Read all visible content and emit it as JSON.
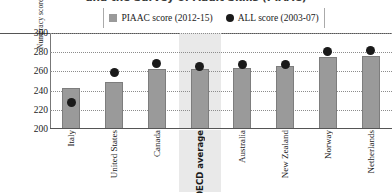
{
  "title": "and the Survey of Adult Skills (PIAAC)",
  "legend": {
    "bar_label": "PIAAC score (2012-15)",
    "dot_label": "ALL score (2003-07)",
    "bar_icon": "square-swatch-icon",
    "dot_icon": "circle-swatch-icon",
    "bar_color": "#9a9a9a",
    "dot_color": "#1a1a1a"
  },
  "axis": {
    "ylabel": "Numeracy score",
    "yticks": [
      "300",
      "280",
      "260",
      "240",
      "220",
      "200"
    ]
  },
  "highlight": {
    "category": "OECD average",
    "color": "#e9e9e9"
  },
  "chart_data": {
    "type": "bar",
    "title": "and the Survey of Adult Skills (PIAAC)",
    "xlabel": "",
    "ylabel": "Numeracy score",
    "ylim": [
      200,
      300
    ],
    "ytick_step": 20,
    "grid": true,
    "legend_position": "top",
    "categories": [
      "Italy",
      "United States",
      "Canada",
      "OECD average",
      "Australia",
      "New Zealand",
      "Norway",
      "Netherlands"
    ],
    "series": [
      {
        "name": "PIAAC score (2012-15)",
        "type": "bar",
        "color": "#9a9a9a",
        "values": [
          243,
          249,
          262,
          263,
          264,
          266,
          275,
          276
        ]
      },
      {
        "name": "ALL score (2003-07)",
        "type": "scatter",
        "color": "#1a1a1a",
        "values": [
          228,
          259,
          268,
          265,
          267,
          267,
          281,
          282
        ]
      }
    ]
  }
}
